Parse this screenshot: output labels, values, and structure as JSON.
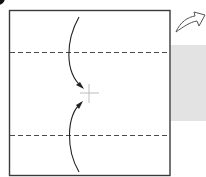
{
  "diagram": {
    "type": "origami-fold-step",
    "colors": {
      "paper_edge": "#3a3a3a",
      "fold_line": "#4a4a4a",
      "arrow": "#222222",
      "reference_mark": "#bdbdbd",
      "back_side_fill": "#e3e3e3",
      "step_marker": "#111111"
    },
    "elements": {
      "paper": {
        "shape": "square",
        "x": 9,
        "y": 10,
        "width": 161,
        "height": 166
      },
      "valley_fold_top": {
        "style": "dashed",
        "y": 52
      },
      "valley_fold_bottom": {
        "style": "dashed",
        "y": 135
      },
      "fold_arrow_top": {
        "direction": "down",
        "target": "center-mark"
      },
      "fold_arrow_bottom": {
        "direction": "up",
        "target": "center-mark"
      },
      "center_mark": {
        "shape": "cross",
        "x": 89,
        "y": 93
      },
      "turn_over_arrow": {
        "meaning": "turn-over"
      },
      "back_side_preview": {
        "shape": "rectangle",
        "x": 171,
        "y": 45,
        "width": 35,
        "height": 76
      }
    }
  }
}
